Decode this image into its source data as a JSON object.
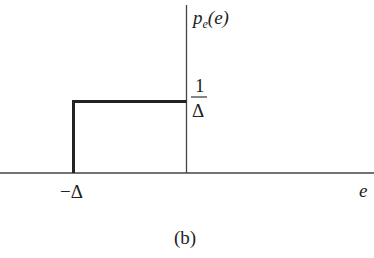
{
  "diagram": {
    "y_axis_label": {
      "base": "p",
      "subscript": "e",
      "arg": "(e)"
    },
    "x_axis_label": "e",
    "height_label": {
      "numerator": "1",
      "denominator": "Δ"
    },
    "x_tick_label": "−Δ",
    "caption": "(b)",
    "shape": "uniform pdf from −Δ to 0 with height 1/Δ",
    "colors": {
      "line": "#222222",
      "axis": "#444444",
      "background": "#ffffff"
    }
  }
}
